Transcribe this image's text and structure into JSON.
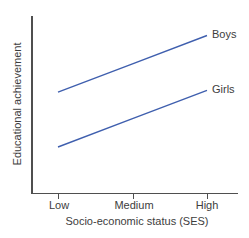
{
  "chart_data": {
    "type": "line",
    "title": "",
    "categories": [
      "Low",
      "Medium",
      "High"
    ],
    "series": [
      {
        "name": "Boys",
        "values": [
          57,
          73,
          89
        ]
      },
      {
        "name": "Girls",
        "values": [
          26,
          42,
          58
        ]
      }
    ],
    "xlabel": "Socio-economic status (SES)",
    "ylabel": "Educational achievement",
    "ylim": [
      0,
      100
    ],
    "grid": false,
    "legend_position": "line-end-labels",
    "line_color": "#3f5fae",
    "axis_color": "#4f4f4f",
    "text_color": "#3d3d3d"
  }
}
